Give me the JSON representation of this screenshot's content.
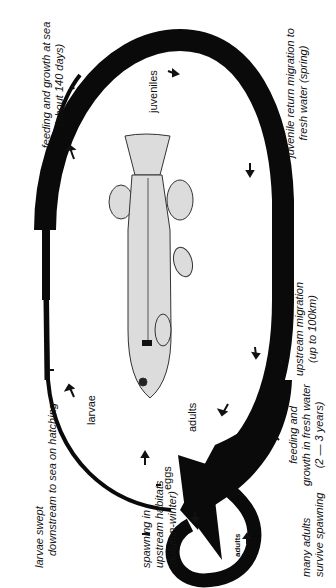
{
  "diagram": {
    "type": "life-cycle",
    "orientation": "rotated-90-ccw",
    "stages": [
      {
        "id": "eggs",
        "label": "eggs"
      },
      {
        "id": "larvae",
        "label": "larvae"
      },
      {
        "id": "juveniles",
        "label": "juveniles"
      },
      {
        "id": "adults",
        "label": "adults"
      },
      {
        "id": "adults_curl",
        "label": "adults"
      }
    ],
    "annotations": {
      "larvae_swept_1": "larvae swept",
      "larvae_swept_2": "downstream to sea on hatching",
      "sea_1": "feeding and growth at sea",
      "sea_2": "(about 140 days)",
      "return_1": "juvenile return migration to",
      "return_2": "fresh water (spring)",
      "upstream_1": "upstream migration",
      "upstream_2": "(up to 100km)",
      "fresh_1": "feeding and",
      "fresh_2": "growth in fresh water",
      "fresh_3": "(2 — 3 years)",
      "spawn_1": "spawning in",
      "spawn_2": "upstream habitats",
      "spawn_3": "(autumn-winter)",
      "survive_1": "many adults",
      "survive_2": "survive spawning"
    },
    "colors": {
      "loop": "#0a0a0a",
      "fish_fill": "#d9d9d9",
      "fish_line": "#333333",
      "background": "#ffffff"
    }
  }
}
